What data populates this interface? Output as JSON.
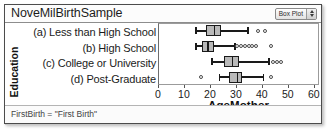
{
  "window": {
    "title": "NoveMilBirthSample",
    "plot_type_select": {
      "value": "Box Plot",
      "options": [
        "Box Plot",
        "Histogram",
        "Dot Plot",
        "Scatter Plot"
      ],
      "stepper_icon": "up-down-arrows-icon"
    }
  },
  "footer": {
    "filter_text": "FirstBirth = \"First Birth\""
  },
  "colors": {
    "box_fill": "#b9b9b9",
    "box_outline": "#1a1a1a",
    "outlier_outline": "#4a4a4a",
    "frame": "#9b9b9b",
    "text": "#1b1b1b"
  },
  "chart_data": {
    "type": "box",
    "title": "NoveMilBirthSample",
    "xlabel": "AgeMother",
    "ylabel": "Education",
    "xlim": [
      0,
      62
    ],
    "xticks": [
      0,
      10,
      20,
      30,
      40,
      50,
      60
    ],
    "xticklabels": [
      "0",
      "10",
      "20",
      "30",
      "40",
      "50",
      "60"
    ],
    "grid": false,
    "legend": false,
    "categories": [
      "(a) Less than High School",
      "(b) High School",
      "(c) College or University",
      "(d) Post-Graduate"
    ],
    "boxes": [
      {
        "category": "(a) Less than High School",
        "whisker_low": 14,
        "q1": 18,
        "median": 21,
        "q3": 24,
        "whisker_high": 34,
        "outliers": [
          38,
          41
        ]
      },
      {
        "category": "(b) High School",
        "whisker_low": 14,
        "q1": 16.5,
        "median": 18.5,
        "q3": 21,
        "whisker_high": 29,
        "outliers": [
          30,
          31.5,
          33,
          34.5,
          36,
          37.5,
          43
        ]
      },
      {
        "category": "(c) College or University",
        "whisker_low": 20,
        "q1": 25,
        "median": 28,
        "q3": 31,
        "whisker_high": 42,
        "outliers": [
          44,
          45.5,
          47
        ]
      },
      {
        "category": "(d) Post-Graduate",
        "whisker_low": 23,
        "q1": 27,
        "median": 30,
        "q3": 32,
        "whisker_high": 40,
        "outliers": [
          16,
          43
        ]
      }
    ]
  }
}
